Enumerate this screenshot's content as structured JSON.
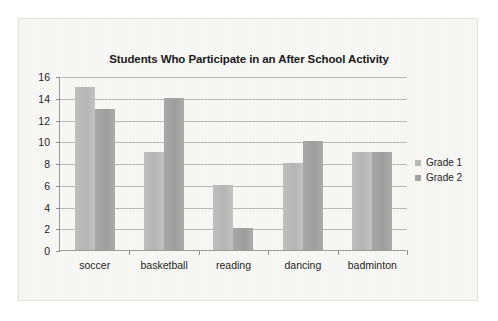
{
  "chart_data": {
    "type": "bar",
    "title": "Students Who Participate in an After School Activity",
    "xlabel": "",
    "ylabel": "",
    "categories": [
      "soccer",
      "basketball",
      "reading",
      "dancing",
      "badminton"
    ],
    "series": [
      {
        "name": "Grade 1",
        "values": [
          15,
          9,
          6,
          8,
          9
        ],
        "color": "#b9b9b9"
      },
      {
        "name": "Grade 2",
        "values": [
          13,
          14,
          2,
          10,
          9
        ],
        "color": "#a2a2a2"
      }
    ],
    "ylim": [
      0,
      16
    ],
    "ytick_step": 2,
    "yticks": [
      0,
      2,
      4,
      6,
      8,
      10,
      12,
      14,
      16
    ],
    "ytick_labels": [
      "0",
      "2",
      "4",
      "6",
      "8",
      "10",
      "12",
      "14",
      "16"
    ],
    "grid": true,
    "grid_axis": "y",
    "legend": true,
    "legend_position": "right"
  },
  "style": {
    "page_background": "#ffffff",
    "card_background": "#f7f7f5",
    "card_border": "#e2e2e0",
    "axis_color": "#9a9a9a",
    "grid_color": "#b9b9b9",
    "text_color": "#1f1f1f",
    "title_color": "#1b1b1b"
  }
}
